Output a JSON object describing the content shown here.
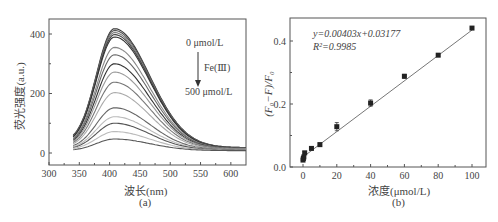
{
  "chart_data": [
    {
      "id": "a",
      "type": "line",
      "panel_label": "(a)",
      "title": "",
      "xlabel": "波长(nm)",
      "ylabel": "荧光强度(a.u.)",
      "xlim": [
        300,
        625
      ],
      "ylim": [
        -30,
        450
      ],
      "xticks": [
        300,
        350,
        400,
        450,
        500,
        550,
        600
      ],
      "yticks": [
        0,
        200,
        400
      ],
      "grid": false,
      "annotation": {
        "top": "0 μmol/L",
        "middle": "Fe(Ⅲ)",
        "bottom": "500 μmol/L",
        "arrow": "down"
      },
      "x_range": [
        340,
        625
      ],
      "peak_wavelength": 408,
      "series_note": "fluorescence emission spectra decreasing with Fe(III) concentration 0 to 500 μmol/L",
      "series": [
        {
          "name": "c1",
          "peak": 418,
          "start": 42,
          "end": 18,
          "color": "#3a3a3a"
        },
        {
          "name": "c2",
          "peak": 412,
          "start": 40,
          "end": 18,
          "color": "#555555"
        },
        {
          "name": "c3",
          "peak": 405,
          "start": 38,
          "end": 17,
          "color": "#777777"
        },
        {
          "name": "c4",
          "peak": 398,
          "start": 36,
          "end": 17,
          "color": "#444444"
        },
        {
          "name": "c5",
          "peak": 390,
          "start": 35,
          "end": 16,
          "color": "#333333"
        },
        {
          "name": "c6",
          "peak": 355,
          "start": 32,
          "end": 15,
          "color": "#888888"
        },
        {
          "name": "c7",
          "peak": 330,
          "start": 30,
          "end": 15,
          "color": "#666666"
        },
        {
          "name": "c8",
          "peak": 300,
          "start": 28,
          "end": 14,
          "color": "#333333"
        },
        {
          "name": "c9",
          "peak": 272,
          "start": 26,
          "end": 14,
          "color": "#999999"
        },
        {
          "name": "c10",
          "peak": 238,
          "start": 24,
          "end": 13,
          "color": "#777777"
        },
        {
          "name": "c11",
          "peak": 203,
          "start": 22,
          "end": 12,
          "color": "#aaaaaa"
        },
        {
          "name": "c12",
          "peak": 152,
          "start": 18,
          "end": 11,
          "color": "#666666"
        },
        {
          "name": "c13",
          "peak": 122,
          "start": 16,
          "end": 10,
          "color": "#bbbbbb"
        },
        {
          "name": "c14",
          "peak": 100,
          "start": 14,
          "end": 10,
          "color": "#555555"
        },
        {
          "name": "c15",
          "peak": 72,
          "start": 12,
          "end": 9,
          "color": "#bbbbbb"
        },
        {
          "name": "c16",
          "peak": 47,
          "start": 8,
          "end": 8,
          "color": "#555555"
        }
      ]
    },
    {
      "id": "b",
      "type": "scatter",
      "panel_label": "(b)",
      "title": "",
      "xlabel": "浓度(μmol/L)",
      "ylabel": "(F₀−F)/F₀",
      "xlim": [
        -8,
        105
      ],
      "ylim": [
        0,
        0.46
      ],
      "xticks": [
        0,
        20,
        40,
        60,
        80,
        100
      ],
      "yticks": [
        0.0,
        0.2,
        0.4
      ],
      "ytick_labels": [
        "0.0",
        "0.2",
        "0.4"
      ],
      "grid": false,
      "equation": "y=0.00403x+0.03177",
      "r_squared": "R²=0.9985",
      "fit": {
        "slope": 0.00403,
        "intercept": 0.03177
      },
      "x": [
        0,
        0.2,
        0.5,
        1,
        5,
        10,
        20,
        40,
        60,
        80,
        100
      ],
      "values": [
        0.022,
        0.027,
        0.032,
        0.045,
        0.059,
        0.071,
        0.128,
        0.203,
        0.288,
        0.355,
        0.441
      ],
      "errors": [
        0.004,
        0.004,
        0.004,
        0.004,
        0.004,
        0.005,
        0.013,
        0.01,
        0.006,
        0.004,
        0.003
      ]
    }
  ]
}
